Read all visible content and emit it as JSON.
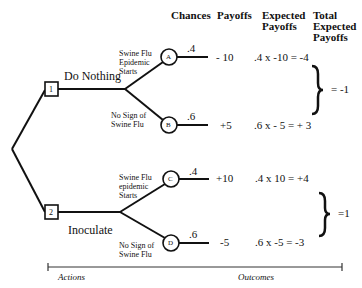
{
  "headers": {
    "chances": "Chances",
    "payoffs": "Payoffs",
    "expected": [
      "Expected",
      "Payoffs"
    ],
    "total": [
      "Total",
      "Expected",
      "Payoffs"
    ]
  },
  "actions": [
    {
      "node": "1",
      "label": "Do Nothing",
      "total": "= -1",
      "branches": [
        {
          "event": [
            "Swine Flu",
            "Epidemic",
            "Starts"
          ],
          "node": "A",
          "chance": ".4",
          "payoff": "- 10",
          "expected": ".4 x -10 = -4"
        },
        {
          "event": [
            "No Sign of",
            "Swine Flu"
          ],
          "node": "B",
          "chance": ".6",
          "payoff": "+5",
          "expected": ".6 x - 5 = + 3"
        }
      ]
    },
    {
      "node": "2",
      "label": "Inoculate",
      "total": "=1",
      "branches": [
        {
          "event": [
            "Swine Flu",
            "epidemic",
            "Starts"
          ],
          "node": "C",
          "chance": ".4",
          "payoff": "+10",
          "expected": ".4 x 10 = +4"
        },
        {
          "event": [
            "No Sign of",
            "Swine Flu"
          ],
          "node": "D",
          "chance": ".6",
          "payoff": "-5",
          "expected": ".6 x -5 = -3"
        }
      ]
    }
  ],
  "axis": {
    "left_label": "Actions",
    "right_label": "Outcomes"
  }
}
